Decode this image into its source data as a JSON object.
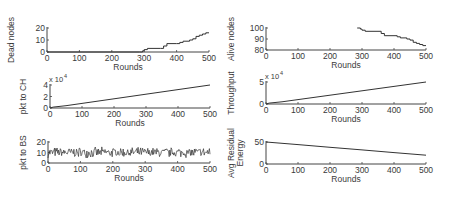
{
  "figure": {
    "line_color": "#333333",
    "axis_color": "#444444"
  },
  "chart_data": [
    {
      "id": "dead",
      "type": "line",
      "title": "",
      "xlabel": "Rounds",
      "ylabel": "Dead nodes",
      "xlim": [
        0,
        500
      ],
      "ylim": [
        0,
        20
      ],
      "xticks": [
        0,
        100,
        200,
        300,
        400,
        500
      ],
      "yticks": [
        0,
        10,
        20
      ],
      "exponent": "",
      "series": [
        {
          "name": "Dead nodes",
          "x": [
            0,
            285,
            295,
            300,
            310,
            350,
            360,
            370,
            400,
            410,
            420,
            440,
            450,
            460,
            470,
            480,
            490,
            500
          ],
          "values": [
            0,
            0,
            1,
            2,
            3,
            3,
            5,
            7,
            7,
            8,
            9,
            10,
            11,
            13,
            14,
            15,
            16,
            16
          ]
        }
      ]
    },
    {
      "id": "alive",
      "type": "line",
      "title": "",
      "xlabel": "Rounds",
      "ylabel": "Alive nodes",
      "xlim": [
        0,
        500
      ],
      "ylim": [
        80,
        100
      ],
      "xticks": [
        0,
        100,
        200,
        300,
        400,
        500
      ],
      "yticks": [
        80,
        90,
        100
      ],
      "exponent": "",
      "series": [
        {
          "name": "Alive nodes",
          "x": [
            285,
            295,
            300,
            310,
            350,
            360,
            370,
            400,
            410,
            420,
            440,
            450,
            460,
            470,
            480,
            490,
            500
          ],
          "values": [
            100,
            99,
            98,
            97,
            97,
            95,
            93,
            93,
            92,
            91,
            90,
            89,
            87,
            86,
            85,
            84,
            84
          ]
        }
      ]
    },
    {
      "id": "pkt_ch",
      "type": "line",
      "title": "",
      "xlabel": "Rounds",
      "ylabel": "pkt to CH",
      "xlim": [
        0,
        500
      ],
      "ylim": [
        0,
        4
      ],
      "xticks": [
        0,
        100,
        200,
        300,
        400,
        500
      ],
      "yticks": [
        0,
        2,
        4
      ],
      "exponent": "x 10^4",
      "series": [
        {
          "name": "pkt to CH (x10^4)",
          "x": [
            0,
            10,
            50,
            100,
            200,
            300,
            400,
            500
          ],
          "values": [
            0,
            0.15,
            0.4,
            0.8,
            1.6,
            2.4,
            3.2,
            4.0
          ]
        }
      ]
    },
    {
      "id": "throughput",
      "type": "line",
      "title": "",
      "xlabel": "Rounds",
      "ylabel": "Throughput",
      "xlim": [
        0,
        500
      ],
      "ylim": [
        0,
        5
      ],
      "xticks": [
        0,
        100,
        200,
        300,
        400,
        500
      ],
      "yticks": [
        0,
        5
      ],
      "exponent": "x 10^4",
      "series": [
        {
          "name": "Throughput (x10^4)",
          "x": [
            0,
            10,
            50,
            100,
            200,
            300,
            400,
            500
          ],
          "values": [
            0,
            0.2,
            0.5,
            1.0,
            2.0,
            3.0,
            4.0,
            5.0
          ]
        }
      ]
    },
    {
      "id": "pkt_bs",
      "type": "line",
      "title": "",
      "xlabel": "Rounds",
      "ylabel": "pkt to BS",
      "xlim": [
        0,
        500
      ],
      "ylim": [
        0,
        20
      ],
      "xticks": [
        0,
        100,
        200,
        300,
        400,
        500
      ],
      "yticks": [
        0,
        10,
        20
      ],
      "exponent": "",
      "noise": {
        "mean": 10,
        "amplitude": 5,
        "count": 500,
        "note": "noisy series fluctuating roughly between 5 and 17"
      },
      "series": [
        {
          "name": "pkt to BS",
          "x": [],
          "values": []
        }
      ]
    },
    {
      "id": "energy",
      "type": "line",
      "title": "",
      "xlabel": "Rounds",
      "ylabel": "Avg Residual Energy",
      "xlim": [
        0,
        500
      ],
      "ylim": [
        0,
        50
      ],
      "xticks": [
        0,
        100,
        200,
        300,
        400,
        500
      ],
      "yticks": [
        0,
        50
      ],
      "exponent": "",
      "series": [
        {
          "name": "Avg Residual Energy",
          "x": [
            0,
            100,
            200,
            300,
            400,
            500
          ],
          "values": [
            50,
            44,
            38,
            32,
            26,
            20
          ]
        }
      ]
    }
  ],
  "layout": {
    "panels": [
      {
        "chart": 0,
        "x0": 47,
        "x1": 209,
        "yTop": 28,
        "yBot": 52,
        "ylabel_x": 14,
        "ylabel_lines": [
          "Dead nodes"
        ]
      },
      {
        "chart": 1,
        "x0": 266,
        "x1": 426,
        "yTop": 28,
        "yBot": 50,
        "ylabel_x": 234,
        "ylabel_lines": [
          "Alive nodes"
        ]
      },
      {
        "chart": 2,
        "x0": 50,
        "x1": 210,
        "yTop": 85,
        "yBot": 108,
        "ylabel_x": 26,
        "ylabel_lines": [
          "pkt to CH"
        ]
      },
      {
        "chart": 3,
        "x0": 266,
        "x1": 426,
        "yTop": 82,
        "yBot": 104,
        "ylabel_x": 234,
        "ylabel_lines": [
          "Throughput"
        ]
      },
      {
        "chart": 4,
        "x0": 48,
        "x1": 210,
        "yTop": 142,
        "yBot": 163,
        "ylabel_x": 26,
        "ylabel_lines": [
          "pkt to BS"
        ]
      },
      {
        "chart": 5,
        "x0": 266,
        "x1": 426,
        "yTop": 142,
        "yBot": 164,
        "ylabel_x": 234,
        "ylabel_lines": [
          "Avg Residual",
          "Energy"
        ]
      }
    ]
  }
}
